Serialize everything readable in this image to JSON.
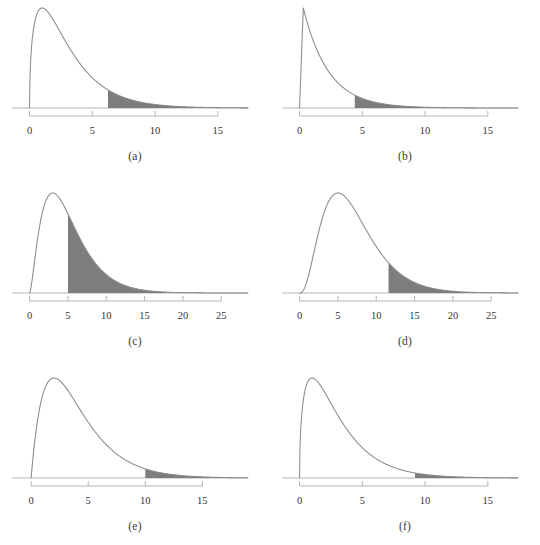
{
  "figure": {
    "background_color": "#ffffff",
    "curve_color": "#8a8a8a",
    "fill_color": "#7d7d7d",
    "axis_color": "#b5b5b5",
    "label_color": "#333333",
    "panel_count": 6
  },
  "chart_data": [
    {
      "type": "area",
      "title": "",
      "caption": "(a)",
      "xlabel": "",
      "ylabel": "",
      "distribution": "chi-square",
      "df": 3,
      "xlim": [
        -0.6,
        17.4
      ],
      "axis_line_max": 17.4,
      "tick_values": [
        0,
        5,
        10,
        15
      ],
      "tick_labels": [
        "0",
        "5",
        "10",
        "15"
      ],
      "shade_from": 6.25,
      "shade_to": 17.4,
      "grid": false,
      "legend": "none"
    },
    {
      "type": "area",
      "title": "",
      "caption": "(b)",
      "xlabel": "",
      "ylabel": "",
      "distribution": "chi-square",
      "df": 2,
      "xlim": [
        -0.6,
        17.4
      ],
      "axis_line_max": 17.4,
      "tick_values": [
        0,
        5,
        10,
        15
      ],
      "tick_labels": [
        "0",
        "5",
        "10",
        "15"
      ],
      "shade_from": 4.4,
      "shade_to": 17.4,
      "grid": false,
      "legend": "none"
    },
    {
      "type": "area",
      "title": "",
      "caption": "(c)",
      "xlabel": "",
      "ylabel": "",
      "distribution": "chi-square",
      "df": 5,
      "xlim": [
        -1.0,
        28.5
      ],
      "axis_line_max": 28.5,
      "tick_values": [
        0,
        5,
        10,
        15,
        20,
        25
      ],
      "tick_labels": [
        "0",
        "5",
        "10",
        "15",
        "20",
        "25"
      ],
      "shade_from": 5.0,
      "shade_to": 28.5,
      "grid": false,
      "legend": "none"
    },
    {
      "type": "area",
      "title": "",
      "caption": "(d)",
      "xlabel": "",
      "ylabel": "",
      "distribution": "chi-square",
      "df": 7,
      "xlim": [
        -1.0,
        28.5
      ],
      "axis_line_max": 28.5,
      "tick_values": [
        0,
        5,
        10,
        15,
        20,
        25
      ],
      "tick_labels": [
        "0",
        "5",
        "10",
        "15",
        "20",
        "25"
      ],
      "shade_from": 11.6,
      "shade_to": 28.5,
      "grid": false,
      "legend": "none"
    },
    {
      "type": "area",
      "title": "",
      "caption": "(e)",
      "xlabel": "",
      "ylabel": "",
      "distribution": "chi-square",
      "df": 4,
      "xlim": [
        -0.8,
        19.0
      ],
      "axis_line_max": 19.0,
      "tick_values": [
        0,
        5,
        10,
        15
      ],
      "tick_labels": [
        "0",
        "5",
        "10",
        "15"
      ],
      "shade_from": 10.0,
      "shade_to": 19.0,
      "grid": false,
      "legend": "none"
    },
    {
      "type": "area",
      "title": "",
      "caption": "(f)",
      "xlabel": "",
      "ylabel": "",
      "distribution": "chi-square",
      "df": 3,
      "xlim": [
        -0.6,
        17.4
      ],
      "axis_line_max": 17.4,
      "tick_values": [
        0,
        5,
        10,
        15
      ],
      "tick_labels": [
        "0",
        "5",
        "10",
        "15"
      ],
      "shade_from": 9.2,
      "shade_to": 17.4,
      "grid": false,
      "legend": "none"
    }
  ]
}
